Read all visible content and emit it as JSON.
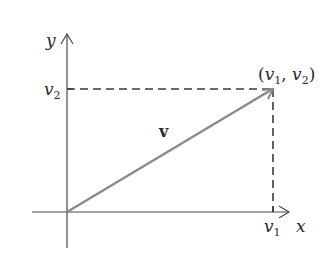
{
  "diagram": {
    "axes": {
      "x_label": "x",
      "y_label": "y"
    },
    "vector": {
      "label": "v",
      "color": "#8a8a8a"
    },
    "point_label": {
      "open": "(",
      "v1": "v",
      "sub1": "1",
      "comma": ", ",
      "v2": "v",
      "sub2": "2",
      "close": ")"
    },
    "tick_labels": {
      "x_tick_main": "v",
      "x_tick_sub": "1",
      "y_tick_main": "v",
      "y_tick_sub": "2"
    },
    "colors": {
      "axis": "#4a4a4a",
      "dashed": "#3a3a3a",
      "vector": "#8a8a8a",
      "text": "#2a2a2a"
    }
  }
}
